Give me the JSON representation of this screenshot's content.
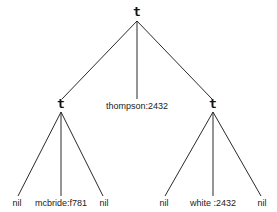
{
  "diagram": {
    "type": "ternary-tree",
    "root": {
      "label": "t",
      "x": 137,
      "y": 16
    },
    "internal": [
      {
        "id": "left",
        "label": "t",
        "x": 61,
        "y": 108
      },
      {
        "id": "middle",
        "label": "thompson:2432",
        "x": 137,
        "y": 109
      },
      {
        "id": "right",
        "label": "t",
        "x": 213,
        "y": 108
      }
    ],
    "leaves": [
      {
        "label": "nil",
        "x": 17,
        "y": 206
      },
      {
        "label": "mcbride:f781",
        "x": 61,
        "y": 206
      },
      {
        "label": "nil",
        "x": 104,
        "y": 206
      },
      {
        "label": "nil",
        "x": 164,
        "y": 206
      },
      {
        "label": "white :2432",
        "x": 213,
        "y": 206
      },
      {
        "label": "nil",
        "x": 262,
        "y": 206
      }
    ],
    "edges": [
      {
        "from": [
          137,
          21
        ],
        "to": [
          62,
          99
        ]
      },
      {
        "from": [
          137,
          21
        ],
        "to": [
          137,
          99
        ]
      },
      {
        "from": [
          137,
          21
        ],
        "to": [
          212,
          99
        ]
      },
      {
        "from": [
          61,
          112
        ],
        "to": [
          18,
          196
        ]
      },
      {
        "from": [
          61,
          112
        ],
        "to": [
          61,
          196
        ]
      },
      {
        "from": [
          61,
          112
        ],
        "to": [
          103,
          196
        ]
      },
      {
        "from": [
          213,
          112
        ],
        "to": [
          165,
          196
        ]
      },
      {
        "from": [
          213,
          112
        ],
        "to": [
          213,
          196
        ]
      },
      {
        "from": [
          213,
          112
        ],
        "to": [
          261,
          196
        ]
      }
    ]
  }
}
